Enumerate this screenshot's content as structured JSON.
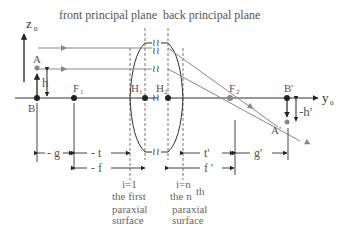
{
  "diagram": {
    "title_front": "front principal plane",
    "title_back": "back principal plane",
    "axes": {
      "z_label": "z",
      "z_sub": "0",
      "y_label": "y",
      "y_sub": "0"
    },
    "points": {
      "A": "A",
      "B": "B",
      "F1": "F",
      "F1_sub": "1",
      "H1": "H",
      "H1_sub": "1",
      "H2": "H",
      "H2_sub": "2",
      "F2": "F",
      "F2_sub": "2",
      "B_prime": "B'",
      "A_prime": "A'"
    },
    "heights": {
      "h": "h",
      "h_prime": "-h'"
    },
    "dimensions": {
      "g": "- g",
      "t": "- t",
      "f": "- f",
      "t_prime": "t'",
      "f_prime": "f '",
      "g_prime": "g'"
    },
    "surfaces": {
      "first_index": "i=1",
      "first_line1": "the first",
      "first_line2": "paraxial",
      "first_line3": "surface",
      "last_index": "i=n",
      "last_line1": "the n",
      "last_sup": "th",
      "last_line2": "paraxial",
      "last_line3": "surface"
    },
    "break_symbol": "≀≀",
    "colors": {
      "axis": "#333333",
      "ray": "#888888",
      "dashed": "#666666",
      "text": "#555555"
    }
  }
}
